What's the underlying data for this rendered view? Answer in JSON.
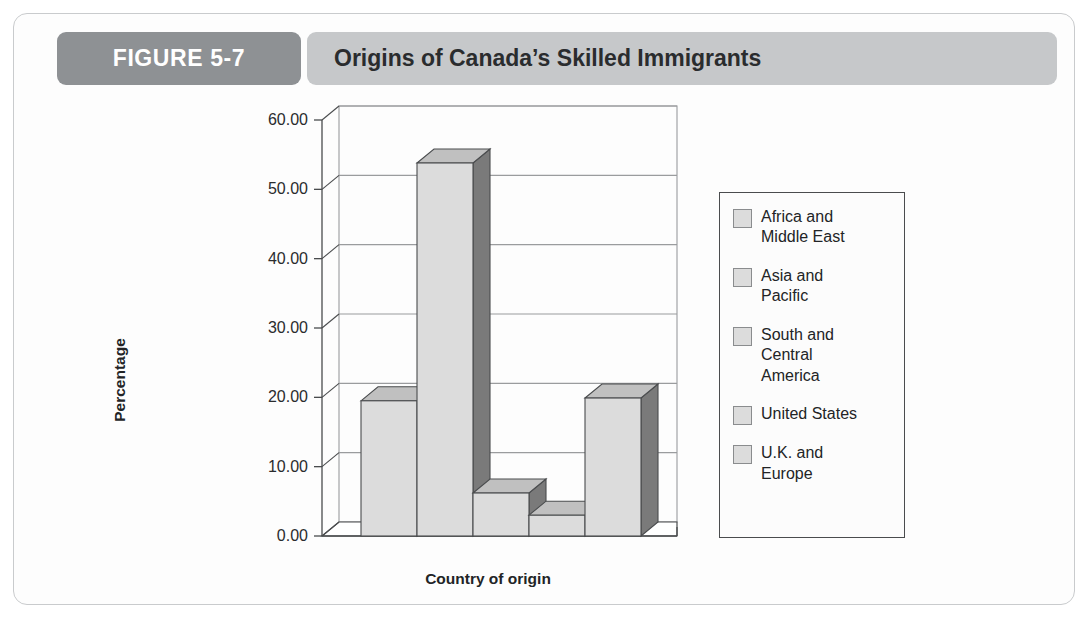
{
  "figure": {
    "number_label": "FIGURE 5-7",
    "title": "Origins of Canada’s Skilled Immigrants"
  },
  "colors": {
    "tab_gray": "#8e9194",
    "band_gray": "#c6c8ca",
    "frame_border": "#c9cbcd",
    "bar_front": "#dcdcdc",
    "bar_top": "#c0c0c0",
    "bar_side": "#7a7a7a",
    "bar_outline": "#4a4c4e",
    "gridline": "#9a9c9e",
    "axis_line": "#4a4c4e",
    "text": "#222426",
    "legend_border": "#4a4c4e",
    "legend_swatch_fill": "#dcdcdc",
    "legend_swatch_border": "#8a8c8e"
  },
  "chart_data": {
    "type": "bar",
    "title": "Origins of Canada’s Skilled Immigrants",
    "subtitle": "",
    "xlabel": "Country of origin",
    "ylabel": "Percentage",
    "ylim": [
      0,
      60
    ],
    "ytick_labels": [
      "60.00",
      "50.00",
      "40.00",
      "30.00",
      "20.00",
      "10.00",
      "0.00"
    ],
    "ytick_values": [
      60,
      50,
      40,
      30,
      20,
      10,
      0
    ],
    "grid": true,
    "three_d": true,
    "legend_position": "right",
    "categories": [
      "Africa and Middle East",
      "Asia and Pacific",
      "South and Central America",
      "United States",
      "U.K. and Europe"
    ],
    "values": [
      19.5,
      53.8,
      6.2,
      3.0,
      19.9
    ],
    "xtick_labels": [],
    "annotations": []
  },
  "legend": {
    "items": [
      {
        "label": "Africa and\nMiddle East",
        "icon": "square-swatch"
      },
      {
        "label": "Asia and\nPacific",
        "icon": "square-swatch"
      },
      {
        "label": "South and\nCentral\nAmerica",
        "icon": "square-swatch"
      },
      {
        "label": "United States",
        "icon": "square-swatch"
      },
      {
        "label": "U.K. and\nEurope",
        "icon": "square-swatch"
      }
    ]
  }
}
